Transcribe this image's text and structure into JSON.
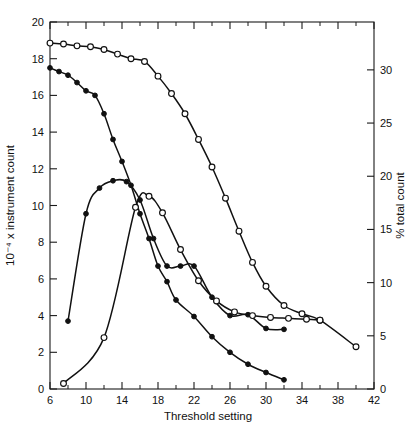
{
  "chart_data": {
    "type": "line",
    "title": "",
    "xlabel": "Threshold setting",
    "ylabel": "10⁻⁴ x instrument count",
    "ylabel_right": "% total count",
    "xlim": [
      6,
      42
    ],
    "ylim": [
      0,
      20
    ],
    "ylim_right": [
      0,
      34.5
    ],
    "grid": false,
    "legend": "none",
    "xticks": [
      6,
      10,
      14,
      18,
      22,
      26,
      30,
      34,
      38,
      42
    ],
    "xticklabels": [
      "6",
      "10",
      "14",
      "18",
      "22",
      "26",
      "30",
      "34",
      "38",
      "42"
    ],
    "xminor_step": 2,
    "yticks": [
      0,
      2,
      4,
      6,
      8,
      10,
      12,
      14,
      16,
      18,
      20
    ],
    "yticklabels": [
      "0",
      "2",
      "4",
      "6",
      "8",
      "10",
      "12",
      "14",
      "16",
      "18",
      "20"
    ],
    "yticks_right": [
      0,
      5,
      10,
      15,
      20,
      25,
      30
    ],
    "yticklabels_right": [
      "0",
      "5",
      "10",
      "15",
      "20",
      "25",
      "30"
    ],
    "series": [
      {
        "name": "integral-open",
        "marker": "open-circle",
        "x": [
          6.0,
          7.5,
          9.0,
          10.5,
          12.0,
          13.5,
          15.0,
          16.5,
          18.0,
          19.5,
          21.0,
          22.5,
          24.0,
          25.5,
          27.0,
          28.5,
          30.0,
          32.0,
          34.0,
          36.0,
          40.0
        ],
        "y": [
          18.85,
          18.8,
          18.7,
          18.65,
          18.5,
          18.25,
          18.0,
          17.85,
          17.05,
          16.1,
          15.0,
          13.6,
          12.1,
          10.4,
          8.6,
          6.9,
          5.6,
          4.55,
          4.1,
          3.75,
          2.3
        ]
      },
      {
        "name": "integral-filled",
        "marker": "filled-circle",
        "x": [
          6.0,
          7.0,
          8.0,
          9.0,
          10.0,
          11.0,
          12.0,
          13.0,
          14.0,
          15.0,
          16.0,
          17.0,
          18.0,
          19.0,
          20.0,
          22.0,
          24.0,
          26.0,
          28.0,
          30.0,
          32.0
        ],
        "y": [
          17.5,
          17.3,
          17.1,
          16.7,
          16.25,
          16.0,
          15.0,
          13.6,
          12.4,
          11.1,
          9.55,
          8.2,
          6.7,
          5.85,
          4.85,
          3.95,
          2.85,
          2.0,
          1.35,
          0.9,
          0.5
        ]
      },
      {
        "name": "differential-filled",
        "marker": "filled-circle",
        "x": [
          8.0,
          10.0,
          11.5,
          13.0,
          14.5,
          16.0,
          17.5,
          19.0,
          20.5,
          22.0,
          24.0,
          26.0,
          28.0,
          30.0,
          32.0
        ],
        "y": [
          3.7,
          9.55,
          10.95,
          11.35,
          11.3,
          10.3,
          8.2,
          6.7,
          6.7,
          6.7,
          5.0,
          4.0,
          4.05,
          3.3,
          3.25
        ]
      },
      {
        "name": "differential-open",
        "marker": "open-circle",
        "x": [
          7.5,
          12.0,
          15.5,
          17.0,
          18.5,
          20.5,
          22.5,
          24.5,
          26.5,
          28.5,
          30.5,
          32.5,
          34.5,
          36.0
        ],
        "y": [
          0.3,
          2.8,
          9.9,
          10.5,
          9.6,
          7.6,
          5.9,
          4.8,
          4.2,
          4.0,
          3.9,
          3.85,
          3.8,
          3.75
        ]
      }
    ]
  }
}
